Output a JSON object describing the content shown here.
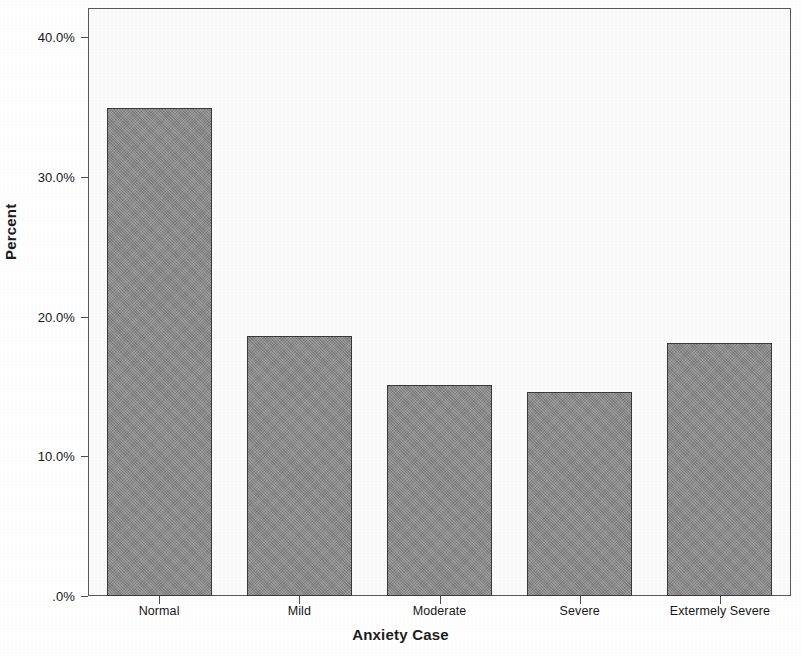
{
  "chart_data": {
    "type": "bar",
    "title": "",
    "xlabel": "Anxiety Case",
    "ylabel": "Percent",
    "categories": [
      "Normal",
      "Mild",
      "Moderate",
      "Severe",
      "Extermely Severe"
    ],
    "values": [
      34.9,
      18.6,
      15.1,
      14.6,
      18.1
    ],
    "ytick_labels": [
      "40.0%",
      "30.0%",
      "20.0%",
      "10.0%",
      ".0%"
    ],
    "ytick_values": [
      40,
      30,
      20,
      10,
      0
    ],
    "ylim": [
      0,
      42
    ],
    "grid": false,
    "legend": null,
    "bar_color": "#8a8a8a",
    "bar_edge_color": "#3a3a3c",
    "plot_background": "#fbfbfb",
    "frame_color": "#59595c"
  }
}
